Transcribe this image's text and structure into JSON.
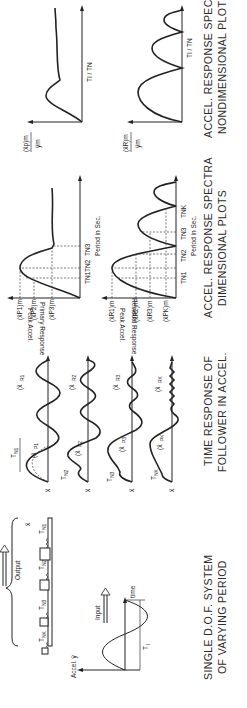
{
  "figure": {
    "orientation": "rotated-90-ccw",
    "panels": [
      {
        "id": "input",
        "caption_line1": "SINGLE D.O.F. SYSTEM",
        "caption_line2": "OF VARYING PERIOD",
        "accel_label": "Accel. ÿ",
        "time_label": "time",
        "pulse_label": "T",
        "pulse_sub": "I",
        "input_label": "Input",
        "output_label": "Output",
        "response_var": "ẍ",
        "oscillators": [
          {
            "label": "T",
            "sub": "N1"
          },
          {
            "label": "T",
            "sub": "N2"
          },
          {
            "label": "T",
            "sub": "N3"
          },
          {
            "label": "T",
            "sub": "NK"
          }
        ]
      },
      {
        "id": "time-response",
        "caption_line1": "TIME RESPONSE OF",
        "caption_line2": "FOLLOWER IN ACCEL.",
        "traces": [
          {
            "var": "ẍ",
            "period": "T",
            "period_sub": "N1",
            "primary": "(ẍ",
            "primary_sub": "P1",
            "residual": "(ẍ",
            "residual_sub": "R1",
            "suffix": ")m"
          },
          {
            "var": "ẍ",
            "period": "T",
            "period_sub": "N2",
            "primary": "(ẍ",
            "primary_sub": "P2",
            "residual": "(ẍ",
            "residual_sub": "R2",
            "suffix": ")m"
          },
          {
            "var": "ẍ",
            "period": "T",
            "period_sub": "N3",
            "primary": "(ẍ",
            "primary_sub": "P3",
            "residual": "(ẍ",
            "residual_sub": "R3",
            "suffix": ")m"
          },
          {
            "var": "ẍ",
            "period": "T",
            "period_sub": "NK",
            "primary": "(ẍ",
            "primary_sub": "PK",
            "residual": "(ẍ",
            "residual_sub": "RK",
            "suffix": ")m"
          }
        ]
      },
      {
        "id": "dimensional-spectra",
        "caption_line1": "ACCEL. RESPONSE SPECTRA",
        "caption_line2": "DIMENSIONAL PLOTS",
        "primary": {
          "ylabel_line1": "Peak Accel.",
          "ylabel_line2": "Primary Response",
          "yticks": [
            "(ẍP1)m",
            "(ẍP2)m",
            "(ẍP3)m"
          ],
          "xticks": [
            "TN1",
            "TN2",
            "TN3"
          ],
          "xlabel": "Period in Sec."
        },
        "residual": {
          "ylabel_line1": "Peak Accel.",
          "ylabel_line2": "Residual Response",
          "yticks": [
            "(ẍR1)m",
            "(ẍR2)m",
            "(ẍR3)m",
            "(ẍPK)m"
          ],
          "xticks": [
            "TN1",
            "TN2",
            "TN3",
            "TNK"
          ],
          "xlabel": "Period in Sec."
        }
      },
      {
        "id": "nondimensional-spectra",
        "caption_line1": "ACCEL. RESPONSE SPECTRA",
        "caption_line2": "NONDIMENSIONAL PLOTS",
        "primary": {
          "ylabel_num": "(ẍp)m",
          "ylabel_den": "ÿm",
          "xlabel": "TI / TN"
        },
        "residual": {
          "ylabel_num": "(ẍR)m",
          "ylabel_den": "ÿm",
          "xlabel": "TI / TN"
        }
      }
    ]
  }
}
